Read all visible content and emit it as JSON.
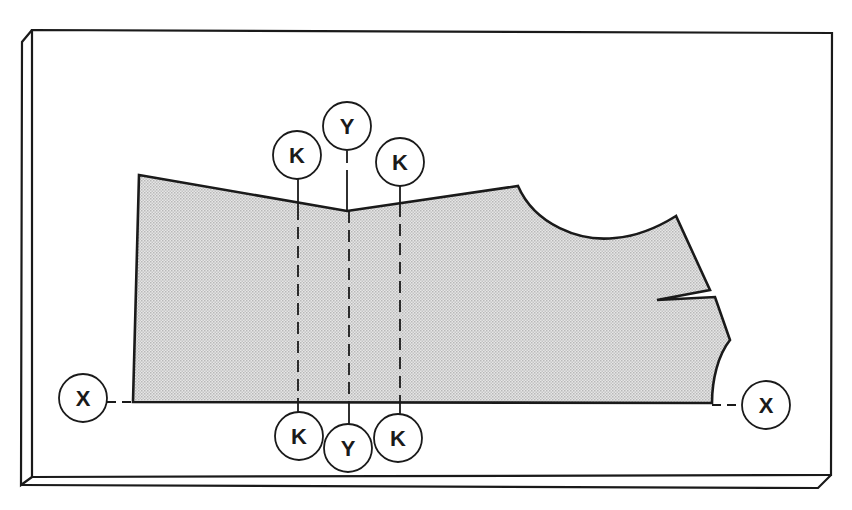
{
  "diagram": {
    "type": "garment pattern layout on cutting board",
    "colors": {
      "stroke": "#1a1a1a",
      "fill_pattern": "#d8d8d8",
      "background": "#ffffff"
    },
    "labels": {
      "k_top_left": "K",
      "y_top": "Y",
      "k_top_right": "K",
      "k_bottom_left": "K",
      "y_bottom": "Y",
      "k_bottom_right": "K",
      "x_left": "X",
      "x_right": "X"
    },
    "reference_lines": [
      {
        "label": "K",
        "type": "dashed vertical",
        "position": "left"
      },
      {
        "label": "Y",
        "type": "dashed vertical",
        "position": "center"
      },
      {
        "label": "K",
        "type": "dashed vertical",
        "position": "right"
      },
      {
        "label": "X",
        "type": "dashed horizontal",
        "position": "bottom edge"
      }
    ]
  }
}
